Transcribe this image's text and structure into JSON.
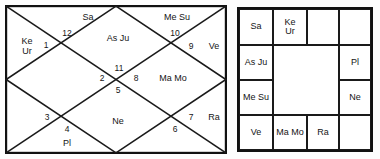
{
  "colors": {
    "line": "#1a1a1a",
    "frame": "#111111",
    "text": "#141414",
    "background": "#ffffff"
  },
  "north_chart": {
    "name": "north-indian-rashi-chart",
    "style": "North Indian diamond",
    "houses": [
      {
        "number": "1",
        "planets": "Ke\nUr",
        "num_x": 41,
        "num_y": 41,
        "txt_x": 22,
        "txt_y": 42
      },
      {
        "number": "12",
        "planets": "Sa",
        "num_x": 62,
        "num_y": 29,
        "txt_x": 83,
        "txt_y": 13
      },
      {
        "number": "11",
        "planets": "As Ju",
        "num_x": 114,
        "num_y": 64,
        "txt_x": 113,
        "txt_y": 34
      },
      {
        "number": "10",
        "planets": "Me Su",
        "num_x": 170,
        "num_y": 29,
        "txt_x": 172,
        "txt_y": 13
      },
      {
        "number": "9",
        "planets": "Ve",
        "num_x": 186,
        "num_y": 42,
        "txt_x": 209,
        "txt_y": 42
      },
      {
        "number": "8",
        "planets": "Ma Mo",
        "num_x": 131,
        "num_y": 74,
        "txt_x": 168,
        "txt_y": 74
      },
      {
        "number": "7",
        "planets": "Ra",
        "num_x": 186,
        "num_y": 113,
        "txt_x": 209,
        "txt_y": 113
      },
      {
        "number": "6",
        "planets": "",
        "num_x": 170,
        "num_y": 125,
        "txt_x": 0,
        "txt_y": 0
      },
      {
        "number": "5",
        "planets": "Ne",
        "num_x": 113,
        "num_y": 86,
        "txt_x": 113,
        "txt_y": 117
      },
      {
        "number": "4",
        "planets": "Pl",
        "num_x": 62,
        "num_y": 125,
        "txt_x": 62,
        "txt_y": 139
      },
      {
        "number": "3",
        "planets": "",
        "num_x": 42,
        "num_y": 113,
        "txt_x": 0,
        "txt_y": 0
      },
      {
        "number": "2",
        "planets": "",
        "num_x": 97,
        "num_y": 74,
        "txt_x": 0,
        "txt_y": 0
      }
    ]
  },
  "south_chart": {
    "name": "south-indian-rashi-chart",
    "style": "South Indian square",
    "cells": [
      {
        "id": "r0c0",
        "planets": "Sa",
        "left": 0,
        "top": 0,
        "width": 34,
        "height": 36
      },
      {
        "id": "r0c1",
        "planets": "Ke\nUr",
        "left": 34,
        "top": 0,
        "width": 34,
        "height": 36
      },
      {
        "id": "r0c2",
        "planets": "",
        "left": 68,
        "top": 0,
        "width": 32,
        "height": 36
      },
      {
        "id": "r0c3",
        "planets": "",
        "left": 100,
        "top": 0,
        "width": 32,
        "height": 36
      },
      {
        "id": "r1c0",
        "planets": "As Ju",
        "left": 0,
        "top": 36,
        "width": 34,
        "height": 35
      },
      {
        "id": "r1c3",
        "planets": "Pl",
        "left": 100,
        "top": 36,
        "width": 32,
        "height": 35
      },
      {
        "id": "r2c0",
        "planets": "Me Su",
        "left": 0,
        "top": 71,
        "width": 34,
        "height": 35
      },
      {
        "id": "r2c3",
        "planets": "Ne",
        "left": 100,
        "top": 71,
        "width": 32,
        "height": 35
      },
      {
        "id": "r3c0",
        "planets": "Ve",
        "left": 0,
        "top": 106,
        "width": 34,
        "height": 35
      },
      {
        "id": "r3c1",
        "planets": "Ma Mo",
        "left": 34,
        "top": 106,
        "width": 34,
        "height": 35
      },
      {
        "id": "r3c2",
        "planets": "Ra",
        "left": 68,
        "top": 106,
        "width": 32,
        "height": 35
      },
      {
        "id": "r3c3",
        "planets": "",
        "left": 100,
        "top": 106,
        "width": 32,
        "height": 35
      }
    ],
    "center": {
      "left": 34,
      "top": 36,
      "width": 66,
      "height": 70
    }
  }
}
